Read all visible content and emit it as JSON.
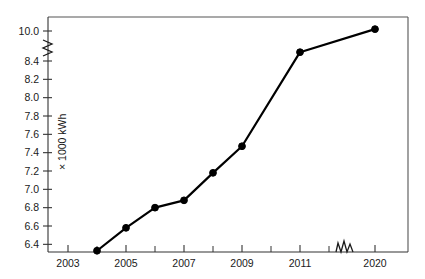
{
  "chart_data": {
    "type": "line",
    "title": "",
    "subtitle": "",
    "xlabel": "",
    "ylabel": "× 1000 kWh",
    "x": [
      2004,
      2005,
      2006,
      2007,
      2008,
      2009,
      2011,
      2020
    ],
    "values": [
      6.33,
      6.58,
      6.8,
      6.88,
      7.18,
      7.47,
      8.87,
      10.1
    ],
    "series": [
      {
        "name": "Consumption",
        "values": [
          6.33,
          6.58,
          6.8,
          6.88,
          7.18,
          7.47,
          8.87,
          10.1
        ]
      }
    ],
    "xlim": [
      2002.5,
      2021.0
    ],
    "ylim": [
      6.3,
      10.15
    ],
    "grid": false,
    "legend": false,
    "legend_position": "none",
    "y_axis_break": {
      "present": true,
      "between": [
        8.4,
        10.0
      ],
      "symbol": "zigzag"
    },
    "x_axis_break": {
      "present": true,
      "between": [
        2012,
        2019
      ],
      "symbol": "zigzag"
    },
    "y_ticks": [
      {
        "value": 6.4,
        "label": "6.4"
      },
      {
        "value": 6.6,
        "label": "6.6"
      },
      {
        "value": 6.8,
        "label": "6.8"
      },
      {
        "value": 7.0,
        "label": "7.0"
      },
      {
        "value": 7.2,
        "label": "7.2"
      },
      {
        "value": 7.4,
        "label": "7.4"
      },
      {
        "value": 7.6,
        "label": "7.6"
      },
      {
        "value": 7.8,
        "label": "7.8"
      },
      {
        "value": 8.0,
        "label": "8.0"
      },
      {
        "value": 8.2,
        "label": "8.2"
      },
      {
        "value": 8.4,
        "label": "8.4"
      },
      {
        "value": 10.0,
        "label": "10.0"
      }
    ],
    "x_ticks": [
      {
        "value": 2003,
        "label": "2003",
        "major": true
      },
      {
        "value": 2004,
        "label": "",
        "major": false
      },
      {
        "value": 2005,
        "label": "2005",
        "major": true
      },
      {
        "value": 2006,
        "label": "",
        "major": false
      },
      {
        "value": 2007,
        "label": "2007",
        "major": true
      },
      {
        "value": 2008,
        "label": "",
        "major": false
      },
      {
        "value": 2009,
        "label": "2009",
        "major": true
      },
      {
        "value": 2010,
        "label": "",
        "major": false
      },
      {
        "value": 2011,
        "label": "2011",
        "major": true
      },
      {
        "value": 2012,
        "label": "",
        "major": false
      },
      {
        "value": 2020,
        "label": "2020",
        "major": true
      }
    ],
    "colors": {
      "line": "#000000",
      "marker": "#000000",
      "axis": "#333333",
      "frame": "#555555",
      "text": "#1a1a1a",
      "background": "#ffffff"
    }
  }
}
